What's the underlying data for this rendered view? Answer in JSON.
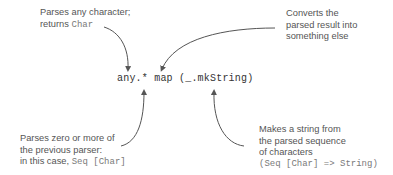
{
  "diagram": {
    "expression": "any.* map (_.mkString)",
    "colors": {
      "annotation_text": "#555555",
      "code_text": "#333333",
      "inline_code": "#7a7a7a",
      "arrow": "#555555",
      "background": "#ffffff"
    },
    "annotations": {
      "top_left": {
        "line1": "Parses any character;",
        "line2_text": "returns ",
        "line2_code": "Char"
      },
      "top_right": {
        "line1": "Converts the",
        "line2": "parsed result into",
        "line3": "something else"
      },
      "bottom_left": {
        "line1": "Parses zero or more of",
        "line2": "the previous parser:",
        "line3_text": "in this case, ",
        "line3_code": "Seq [Char]"
      },
      "bottom_right": {
        "line1": "Makes a string from",
        "line2": "the parsed sequence",
        "line3": "of characters",
        "line4_code": "(Seq [Char] => String)"
      }
    }
  }
}
